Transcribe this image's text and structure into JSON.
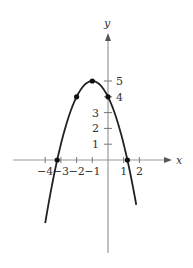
{
  "chart_data": {
    "type": "line",
    "title": "",
    "xlabel": "x",
    "ylabel": "y",
    "xlim": [
      -4.6,
      3.9
    ],
    "ylim": [
      -5.8,
      7.9
    ],
    "equation": "y = -(x+1)^2 + 5",
    "x_ticks": [
      -4,
      -3,
      -2,
      -1,
      1,
      2
    ],
    "x_tick_labels": [
      "−4",
      "−3",
      "−2",
      "−1",
      "1",
      "2"
    ],
    "y_ticks": [
      1,
      2,
      3,
      4,
      5
    ],
    "y_tick_labels": [
      "1",
      "2",
      "3",
      "4",
      "5"
    ],
    "series": [
      {
        "name": "parabola",
        "x_range": [
          -4.0,
          1.8
        ],
        "color": "#222222"
      }
    ],
    "points": [
      {
        "x": -3.236,
        "y": 0
      },
      {
        "x": -2,
        "y": 4
      },
      {
        "x": -1,
        "y": 5
      },
      {
        "x": 0,
        "y": 4
      },
      {
        "x": 1.236,
        "y": 0
      }
    ],
    "grid": false
  }
}
